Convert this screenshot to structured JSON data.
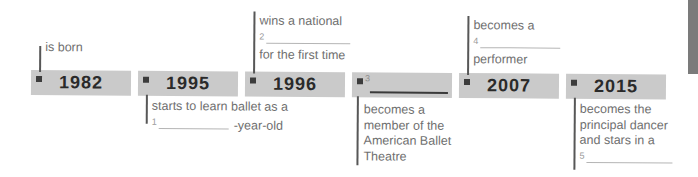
{
  "colors": {
    "bar_background": "#cacaca",
    "year_text": "#2a2a2a",
    "note_text": "#6f6f6f",
    "connector_line": "#575757",
    "marker": "#3c3c3c",
    "blank_underline_light": "#b5b5b5",
    "blank_underline_dark": "#3a3a3a",
    "page_tab": "#7b7b7b"
  },
  "timeline": {
    "events": [
      {
        "year": "1982",
        "note_position": "above",
        "note": {
          "line1": "is born"
        }
      },
      {
        "year": "1995",
        "note_position": "below",
        "note": {
          "line1": "starts to learn ballet as a",
          "blank_number": "1",
          "after_blank": "-year-old"
        }
      },
      {
        "year": "1996",
        "note_position": "above",
        "note": {
          "line1": "wins a national",
          "blank_number": "2",
          "line3": "for the first time"
        }
      },
      {
        "year": "",
        "year_blank_number": "3",
        "note_position": "below",
        "note": {
          "line1": "becomes a",
          "line2": "member of the",
          "line3": "American Ballet",
          "line4": "Theatre"
        }
      },
      {
        "year": "2007",
        "note_position": "above",
        "note": {
          "line1": "becomes a",
          "blank_number": "4",
          "line3": "performer"
        }
      },
      {
        "year": "2015",
        "note_position": "below",
        "note": {
          "line1": "becomes the",
          "line2": "principal dancer",
          "line3": "and stars in a",
          "blank_number": "5"
        }
      }
    ]
  }
}
